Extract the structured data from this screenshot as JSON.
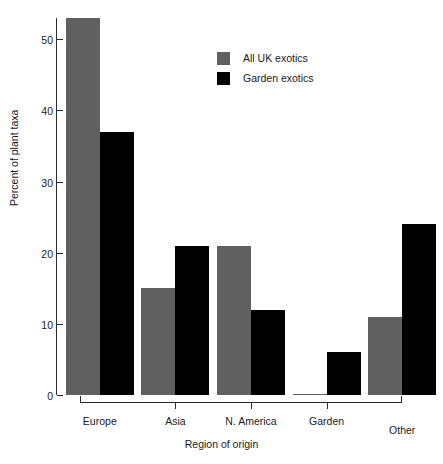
{
  "chart_data": {
    "type": "bar",
    "title": "",
    "xlabel": "Region of origin",
    "ylabel": "Percent of plant taxa",
    "categories": [
      "Europe",
      "Asia",
      "N. America",
      "Garden",
      "Other"
    ],
    "series": [
      {
        "name": "All UK exotics",
        "color": "#606060",
        "values": [
          53,
          15,
          21,
          0,
          11
        ]
      },
      {
        "name": "Garden exotics",
        "color": "#000000",
        "values": [
          37,
          21,
          12,
          6,
          24
        ]
      }
    ],
    "ylim": [
      0,
      53
    ],
    "yticks": [
      0,
      10,
      20,
      30,
      40,
      50
    ],
    "ytick_labels": [
      "0",
      "10",
      "20",
      "30",
      "40",
      "50"
    ],
    "grid": false,
    "legend_position": "top-center"
  },
  "legend": {
    "entries": [
      {
        "label": "All UK exotics",
        "swatch": "series-a"
      },
      {
        "label": "Garden exotics",
        "swatch": "series-b"
      }
    ]
  },
  "axes": {
    "y_title": "Percent of plant taxa",
    "x_title": "Region of origin"
  }
}
